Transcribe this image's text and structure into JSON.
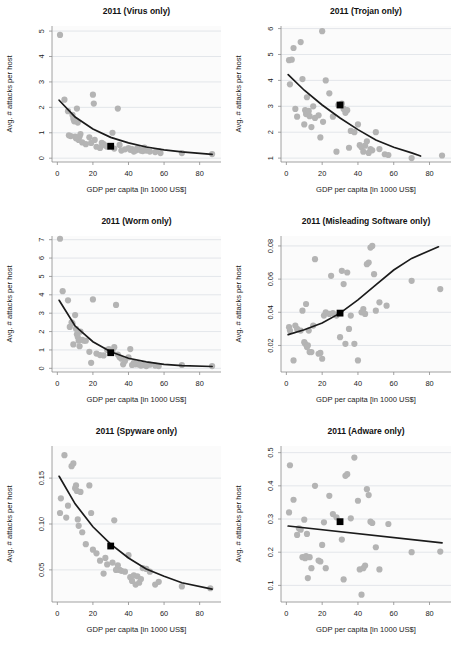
{
  "figure": {
    "type": "multi-panel-scatter",
    "panels": 6,
    "layout": "3 rows x 2 columns",
    "shared_xlabel": "GDP per capita [in 1000 US$]",
    "shared_ylabel": "Avg. # attacks per host",
    "point_color": "#b4b4b4",
    "fit_color": "#1b1b1b",
    "highlight_color": "#000000",
    "grid": true,
    "legend": "none"
  },
  "chart_data": [
    {
      "type": "scatter",
      "title": "2011 (Virus only)",
      "xlabel": "GDP per capita [in 1000 US$]",
      "ylabel": "Avg. # attacks per host",
      "xlim": [
        -3,
        92
      ],
      "ylim": [
        -0.15,
        5.2
      ],
      "xticks": [
        0,
        20,
        40,
        60,
        80
      ],
      "yticks": [
        0,
        1,
        2,
        3,
        4,
        5
      ],
      "ytick_labels": [
        "0",
        "1",
        "2",
        "3",
        "4",
        "5"
      ],
      "fit": "exponential decay",
      "fit_points": [
        [
          1,
          2.28
        ],
        [
          10,
          1.62
        ],
        [
          20,
          1.15
        ],
        [
          30,
          0.82
        ],
        [
          40,
          0.6
        ],
        [
          50,
          0.44
        ],
        [
          60,
          0.33
        ],
        [
          70,
          0.25
        ],
        [
          87,
          0.15
        ]
      ],
      "highlight": {
        "x": 30,
        "y": 0.47,
        "label": "mean"
      },
      "x": [
        1.5,
        4,
        6,
        6.5,
        7.5,
        8.5,
        9,
        9.5,
        10,
        10.5,
        11,
        11.5,
        12,
        12.5,
        13,
        14,
        16,
        18,
        19,
        20,
        20.5,
        21,
        22,
        24,
        25,
        26,
        27,
        28,
        30,
        31,
        32,
        34,
        35,
        36,
        38,
        40,
        41,
        42,
        43,
        44,
        45,
        46,
        47,
        48,
        49,
        50,
        52,
        55,
        57,
        58,
        70,
        87
      ],
      "y": [
        4.85,
        2.3,
        1.85,
        0.9,
        0.87,
        1.7,
        1.55,
        1.45,
        0.85,
        0.78,
        1.95,
        1.4,
        0.72,
        0.85,
        0.95,
        0.62,
        0.55,
        0.82,
        0.6,
        2.5,
        2.15,
        0.72,
        0.45,
        0.4,
        0.6,
        0.55,
        0.5,
        0.45,
        0.47,
        1.0,
        0.38,
        1.95,
        0.52,
        0.3,
        0.35,
        0.4,
        0.33,
        0.36,
        0.26,
        0.3,
        0.4,
        0.34,
        0.3,
        0.28,
        0.42,
        0.3,
        0.26,
        0.24,
        0.28,
        0.2,
        0.2,
        0.16
      ]
    },
    {
      "type": "scatter",
      "title": "2011 (Trojan only)",
      "xlabel": "GDP per capita [in 1000 US$]",
      "ylabel": "Avg. # attacks per host",
      "xlim": [
        -3,
        92
      ],
      "ylim": [
        0.85,
        6.1
      ],
      "xticks": [
        0,
        20,
        40,
        60,
        80
      ],
      "yticks": [
        1,
        2,
        3,
        4,
        5,
        6
      ],
      "ytick_labels": [
        "1",
        "2",
        "3",
        "4",
        "5",
        "6"
      ],
      "fit": "exponential decay",
      "fit_points": [
        [
          1,
          4.22
        ],
        [
          10,
          3.62
        ],
        [
          20,
          3.05
        ],
        [
          30,
          2.55
        ],
        [
          40,
          2.1
        ],
        [
          50,
          1.7
        ],
        [
          60,
          1.42
        ],
        [
          70,
          1.2
        ],
        [
          75,
          1.08
        ]
      ],
      "highlight": {
        "x": 30,
        "y": 3.05,
        "label": "mean"
      },
      "x": [
        1.5,
        2,
        3,
        4,
        5,
        6,
        8,
        9,
        10,
        10.5,
        11,
        11.5,
        12,
        12.5,
        13,
        14,
        15,
        16,
        18,
        19,
        20,
        20.5,
        22,
        24,
        26,
        28,
        29,
        30,
        31,
        32,
        33,
        34,
        35,
        36,
        38,
        40,
        41,
        42,
        43,
        44,
        45,
        46,
        47,
        48,
        50,
        52,
        55,
        57,
        70,
        87
      ],
      "y": [
        4.78,
        3.85,
        4.8,
        5.25,
        2.9,
        2.6,
        5.48,
        4.05,
        2.3,
        2.85,
        2.7,
        3.35,
        2.75,
        2.82,
        2.62,
        2.2,
        3.0,
        2.55,
        2.65,
        1.8,
        5.9,
        2.4,
        4.0,
        3.5,
        2.6,
        1.25,
        3.05,
        3.05,
        3.1,
        2.9,
        2.75,
        2.85,
        1.4,
        2.05,
        2.0,
        2.3,
        1.5,
        1.42,
        1.25,
        1.48,
        1.65,
        1.2,
        1.35,
        1.3,
        2.0,
        1.35,
        1.15,
        1.12,
        1.0,
        1.1
      ]
    },
    {
      "type": "scatter",
      "title": "2011 (Worm only)",
      "xlabel": "GDP per capita [in 1000 US$]",
      "ylabel": "Avg. # attacks per host",
      "xlim": [
        -3,
        92
      ],
      "ylim": [
        -0.2,
        7.2
      ],
      "xticks": [
        0,
        20,
        40,
        60,
        80
      ],
      "yticks": [
        0,
        1,
        2,
        3,
        4,
        5,
        6,
        7
      ],
      "ytick_labels": [
        "0",
        "1",
        "2",
        "3",
        "4",
        "5",
        "6",
        "7"
      ],
      "fit": "exponential decay",
      "fit_points": [
        [
          1,
          3.7
        ],
        [
          10,
          2.3
        ],
        [
          20,
          1.45
        ],
        [
          30,
          0.9
        ],
        [
          40,
          0.55
        ],
        [
          50,
          0.35
        ],
        [
          60,
          0.22
        ],
        [
          70,
          0.15
        ],
        [
          87,
          0.1
        ]
      ],
      "highlight": {
        "x": 30,
        "y": 0.85,
        "label": "mean"
      },
      "x": [
        1.5,
        3,
        6,
        7,
        8,
        8.5,
        9,
        10,
        10.5,
        11,
        11.5,
        12,
        12.5,
        13,
        14,
        15,
        16,
        18,
        19,
        20,
        22,
        24,
        26,
        28,
        29,
        30,
        31,
        32,
        33,
        34,
        35,
        36,
        37,
        38,
        40,
        41,
        42,
        43,
        44,
        45,
        46,
        47,
        48,
        50,
        52,
        55,
        57,
        70,
        87
      ],
      "y": [
        7.05,
        4.2,
        3.7,
        2.25,
        2.5,
        2.45,
        1.3,
        2.9,
        2.15,
        1.85,
        1.7,
        1.5,
        1.2,
        2.0,
        1.55,
        1.5,
        1.5,
        0.9,
        0.3,
        3.75,
        0.8,
        0.72,
        0.7,
        1.0,
        1.05,
        0.85,
        0.95,
        1.15,
        3.45,
        0.75,
        0.6,
        0.52,
        0.22,
        0.4,
        0.6,
        1.05,
        0.18,
        0.3,
        0.22,
        0.25,
        0.2,
        0.15,
        0.18,
        0.12,
        0.2,
        0.15,
        0.12,
        0.18,
        0.12
      ]
    },
    {
      "type": "scatter",
      "title": "2011 (Misleading Software only)",
      "xlabel": "GDP per capita [in 1000 US$]",
      "ylabel": "Avg. # attacks per host",
      "xlim": [
        -3,
        92
      ],
      "ylim": [
        0.004,
        0.086
      ],
      "xticks": [
        0,
        20,
        40,
        60,
        80
      ],
      "yticks": [
        0.02,
        0.04,
        0.06,
        0.08
      ],
      "ytick_labels": [
        "0.02",
        "0.04",
        "0.06",
        "0.08"
      ],
      "fit": "exponential growth",
      "fit_points": [
        [
          1,
          0.0265
        ],
        [
          10,
          0.0295
        ],
        [
          20,
          0.0335
        ],
        [
          30,
          0.0395
        ],
        [
          40,
          0.0475
        ],
        [
          50,
          0.0565
        ],
        [
          60,
          0.0655
        ],
        [
          70,
          0.0725
        ],
        [
          85,
          0.0795
        ]
      ],
      "highlight": {
        "x": 30,
        "y": 0.0395,
        "label": "mean"
      },
      "x": [
        1.5,
        2,
        4,
        5,
        6,
        8,
        9,
        10,
        10.5,
        11,
        11.5,
        12,
        12.5,
        13,
        14,
        15,
        16,
        18,
        19,
        20,
        21,
        22,
        24,
        25,
        26,
        28,
        30,
        31,
        32,
        33,
        34,
        35,
        36,
        38,
        40,
        42,
        43,
        44,
        45,
        46,
        47,
        48,
        49,
        50,
        52,
        56,
        70,
        86
      ],
      "y": [
        0.031,
        0.029,
        0.011,
        0.032,
        0.03,
        0.029,
        0.041,
        0.022,
        0.021,
        0.045,
        0.019,
        0.02,
        0.029,
        0.016,
        0.016,
        0.032,
        0.072,
        0.015,
        0.0155,
        0.012,
        0.038,
        0.04,
        0.039,
        0.062,
        0.0395,
        0.038,
        0.025,
        0.065,
        0.057,
        0.021,
        0.064,
        0.03,
        0.038,
        0.021,
        0.011,
        0.04,
        0.042,
        0.039,
        0.069,
        0.07,
        0.079,
        0.08,
        0.063,
        0.041,
        0.046,
        0.044,
        0.059,
        0.054
      ]
    },
    {
      "type": "scatter",
      "title": "2011 (Spyware only)",
      "xlabel": "GDP per capita [in 1000 US$]",
      "ylabel": "Avg. # attacks per host",
      "xlim": [
        -3,
        92
      ],
      "ylim": [
        0.015,
        0.185
      ],
      "xticks": [
        0,
        20,
        40,
        60,
        80
      ],
      "yticks": [
        0.05,
        0.1,
        0.15
      ],
      "ytick_labels": [
        "0.05",
        "0.10",
        "0.15"
      ],
      "fit": "exponential decay",
      "fit_points": [
        [
          1,
          0.152
        ],
        [
          10,
          0.122
        ],
        [
          20,
          0.097
        ],
        [
          30,
          0.078
        ],
        [
          40,
          0.063
        ],
        [
          50,
          0.051
        ],
        [
          60,
          0.043
        ],
        [
          70,
          0.036
        ],
        [
          87,
          0.029
        ]
      ],
      "highlight": {
        "x": 30,
        "y": 0.076,
        "label": "mean"
      },
      "x": [
        1.5,
        2,
        4,
        5,
        6,
        8,
        9,
        10,
        10.5,
        11,
        11.5,
        12,
        13,
        14,
        16,
        18,
        19,
        20,
        22,
        24,
        26,
        27,
        28,
        30,
        31,
        32,
        33,
        34,
        35,
        36,
        38,
        40,
        41,
        42,
        43,
        44,
        45,
        46,
        47,
        48,
        50,
        52,
        55,
        57,
        70,
        86
      ],
      "y": [
        0.112,
        0.128,
        0.175,
        0.107,
        0.12,
        0.163,
        0.166,
        0.139,
        0.142,
        0.136,
        0.105,
        0.098,
        0.135,
        0.091,
        0.078,
        0.142,
        0.112,
        0.072,
        0.068,
        0.06,
        0.046,
        0.063,
        0.056,
        0.076,
        0.058,
        0.104,
        0.05,
        0.055,
        0.05,
        0.049,
        0.048,
        0.066,
        0.042,
        0.038,
        0.044,
        0.034,
        0.043,
        0.036,
        0.04,
        0.052,
        0.051,
        0.048,
        0.034,
        0.037,
        0.032,
        0.03
      ]
    },
    {
      "type": "scatter",
      "title": "2011 (Adware only)",
      "xlabel": "GDP per capita [in 1000 US$]",
      "ylabel": "Avg. # attacks per host",
      "xlim": [
        -3,
        92
      ],
      "ylim": [
        0.05,
        0.52
      ],
      "xticks": [
        0,
        20,
        40,
        60,
        80
      ],
      "yticks": [
        0.1,
        0.2,
        0.3,
        0.4,
        0.5
      ],
      "ytick_labels": [
        "0.1",
        "0.2",
        "0.3",
        "0.4",
        "0.5"
      ],
      "fit": "linear",
      "fit_points": [
        [
          1,
          0.279
        ],
        [
          87,
          0.228
        ]
      ],
      "highlight": {
        "x": 30,
        "y": 0.292,
        "label": "mean"
      },
      "x": [
        1.5,
        2,
        4,
        6,
        7,
        8,
        9,
        10,
        10.5,
        11,
        11.5,
        12,
        13,
        14,
        16,
        18,
        19,
        20,
        21,
        22,
        24,
        26,
        28,
        30,
        31,
        32,
        33,
        34,
        36,
        38,
        40,
        41,
        42,
        43,
        44,
        45,
        46,
        47,
        48,
        50,
        52,
        57,
        70,
        86
      ],
      "y": [
        0.32,
        0.462,
        0.358,
        0.252,
        0.272,
        0.268,
        0.185,
        0.298,
        0.182,
        0.188,
        0.255,
        0.122,
        0.185,
        0.152,
        0.4,
        0.175,
        0.172,
        0.222,
        0.29,
        0.152,
        0.37,
        0.315,
        0.305,
        0.292,
        0.238,
        0.118,
        0.43,
        0.435,
        0.302,
        0.485,
        0.355,
        0.148,
        0.072,
        0.152,
        0.16,
        0.39,
        0.372,
        0.292,
        0.288,
        0.215,
        0.148,
        0.285,
        0.2,
        0.202
      ]
    }
  ]
}
